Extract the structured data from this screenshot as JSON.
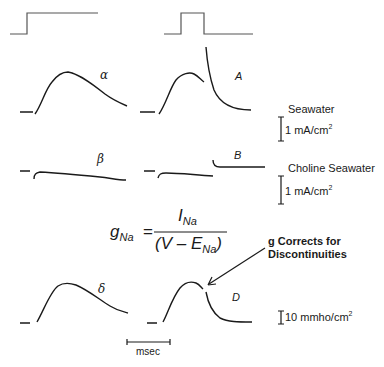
{
  "labels": {
    "alpha": "α",
    "A": "A",
    "beta": "β",
    "B": "B",
    "delta": "δ",
    "D": "D"
  },
  "scales": {
    "seawater_label": "Seawater",
    "seawater_scale": "1 mA/cm",
    "choline_label": "Choline Seawater",
    "choline_scale": "1 mA/cm",
    "conductance_scale": "10 mmho/cm",
    "sup": "2",
    "time_scale": "msec"
  },
  "equation": {
    "lhs": "g",
    "lhs_sub": "Na",
    "equals": "=",
    "numerator": "I",
    "numerator_sub": "Na",
    "denominator_open": "(V – E",
    "denominator_sub": "Na",
    "denominator_close": ")"
  },
  "annotation": {
    "line1": "g Corrects for",
    "line2": "Discontinuities"
  }
}
